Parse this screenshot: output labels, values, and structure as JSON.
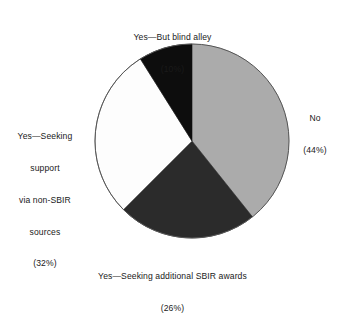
{
  "chart_data": {
    "type": "pie",
    "title": "",
    "subtitle": "",
    "xlabel": "",
    "ylabel": "",
    "legend_position": "none",
    "grid": false,
    "start_angle_deg": 0,
    "direction": "clockwise",
    "categories": [
      "No",
      "Yes—Seeking additional SBIR awards",
      "Yes—Seeking support via non-SBIR sources",
      "Yes—But blind alley"
    ],
    "values": [
      44,
      26,
      32,
      10
    ],
    "value_unit": "%",
    "colors": [
      "#ababab",
      "#2b2b2b",
      "#fdfdfd",
      "#0d0d0d"
    ],
    "slices": [
      {
        "name": "No",
        "value": 44,
        "value_text": "(44%)",
        "color": "#ababab",
        "label_lines": [
          "No",
          "(44%)"
        ]
      },
      {
        "name": "Yes—Seeking additional SBIR awards",
        "value": 26,
        "value_text": "(26%)",
        "color": "#2b2b2b",
        "label_lines": [
          "Yes—Seeking additional SBIR awards",
          "(26%)"
        ]
      },
      {
        "name": "Yes—Seeking support via non-SBIR sources",
        "value": 32,
        "value_text": "(32%)",
        "color": "#fdfdfd",
        "label_lines": [
          "Yes—Seeking",
          "support",
          "via non-SBIR",
          "sources",
          "(32%)"
        ]
      },
      {
        "name": "Yes—But blind alley",
        "value": 10,
        "value_text": "(10%)",
        "color": "#0d0d0d",
        "label_lines": [
          "Yes—But blind alley",
          "(10%)"
        ]
      }
    ]
  },
  "labels": {
    "blind_alley": {
      "line1": "Yes—But blind alley",
      "line2": "(10%)"
    },
    "no": {
      "line1": "No",
      "line2": "(44%)"
    },
    "non_sbir": {
      "line1": "Yes—Seeking",
      "line2": "support",
      "line3": "via non-SBIR",
      "line4": "sources",
      "line5": "(32%)"
    },
    "additional_sbir": {
      "line1": "Yes—Seeking additional SBIR awards",
      "line2": "(26%)"
    }
  },
  "geometry": {
    "center_x": 192,
    "center_y": 141,
    "radius": 97,
    "outline_color": "#555555"
  }
}
